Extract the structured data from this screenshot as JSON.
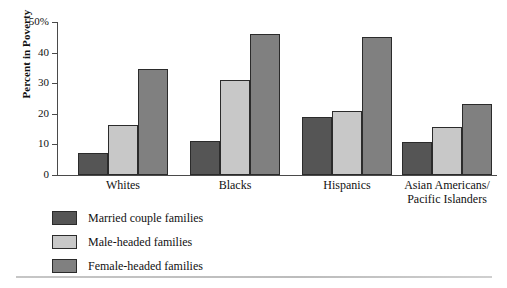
{
  "chart_data": {
    "type": "bar",
    "title": "",
    "xlabel": "",
    "ylabel": "Percent in Poverty",
    "ylim": [
      0,
      50
    ],
    "yticks": [
      0,
      10,
      20,
      30,
      40,
      50
    ],
    "ytick_labels": [
      "0",
      "10",
      "20",
      "30",
      "40",
      "50%"
    ],
    "grid": false,
    "legend_position": "below-axes-left",
    "categories": [
      "Whites",
      "Blacks",
      "Hispanics",
      "Asian Americans/\nPacific Islanders"
    ],
    "series": [
      {
        "name": "Married couple families",
        "color": "#555555",
        "values": [
          7.2,
          11.1,
          19.0,
          10.8
        ]
      },
      {
        "name": "Male-headed families",
        "color": "#c8c8c8",
        "values": [
          16.3,
          30.9,
          21.0,
          15.7
        ]
      },
      {
        "name": "Female-headed families",
        "color": "#808080",
        "values": [
          34.5,
          46.0,
          45.0,
          23.2
        ]
      }
    ]
  },
  "colors": {
    "married": "#555555",
    "male_headed": "#c8c8c8",
    "female_headed": "#808080",
    "axis": "#4a4a4a",
    "bar_outline": "#2b2b2b",
    "bottom_rule": "#c6c6c6"
  },
  "axis": {
    "y_title": "Percent in Poverty",
    "tick_50": "50%",
    "tick_40": "40",
    "tick_30": "30",
    "tick_20": "20",
    "tick_10": "10",
    "tick_0": "0"
  },
  "categories": {
    "whites": "Whites",
    "blacks": "Blacks",
    "hispanics": "Hispanics",
    "asian": "Asian Americans/\nPacific Islanders"
  },
  "legend": {
    "married": "Married couple families",
    "male_headed": "Male-headed families",
    "female_headed": "Female-headed families"
  }
}
